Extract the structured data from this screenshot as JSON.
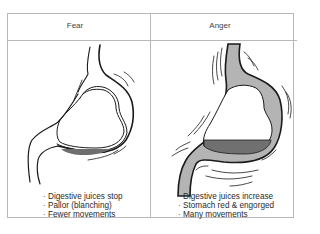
{
  "panels": [
    {
      "title": "Fear",
      "effects": [
        "Digestive juices stop",
        "Pallor (blanching)",
        "Fewer movements"
      ]
    },
    {
      "title": "Anger",
      "effects": [
        "Digestive juices increase",
        "Stomach red & engorged",
        "Many movements"
      ]
    }
  ],
  "colors": {
    "border": "#b8b8b8",
    "line": "#1a1a1a",
    "engorged_wall": "#b4b4b4",
    "juices_fear": "#6e6e6e",
    "juices_anger": "#707070"
  }
}
